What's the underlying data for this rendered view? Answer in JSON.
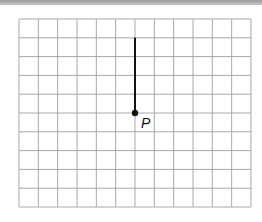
{
  "diagram": {
    "type": "coordinate-grid",
    "grid": {
      "columns": 12,
      "rows": 10,
      "left": 19,
      "top": 19,
      "right": 251,
      "bottom": 207,
      "line_color": "#a9a9a9"
    },
    "segment": {
      "from_grid": [
        6,
        5
      ],
      "to_grid": [
        6,
        1
      ],
      "length_units": 4,
      "direction": "up",
      "color": "#111111"
    },
    "point": {
      "label": "P",
      "grid": [
        6,
        5
      ]
    }
  }
}
